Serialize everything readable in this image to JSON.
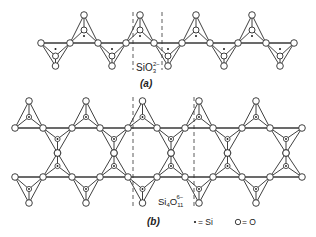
{
  "figure": {
    "part_a": {
      "caption": "(a)",
      "formula_main": "SiO",
      "formula_sub": "3",
      "formula_sup": "2−",
      "description": "single-chain silicate (pyroxene)"
    },
    "part_b": {
      "caption": "(b)",
      "formula_main": "Si",
      "formula_sub1": "4",
      "formula_main2": "O",
      "formula_sub2": "11",
      "formula_sup": "6−",
      "description": "double-chain silicate (amphibole)"
    },
    "legend": {
      "si_symbol": "•",
      "si_label": "= Si",
      "o_symbol": "O",
      "o_label": "= O"
    }
  }
}
